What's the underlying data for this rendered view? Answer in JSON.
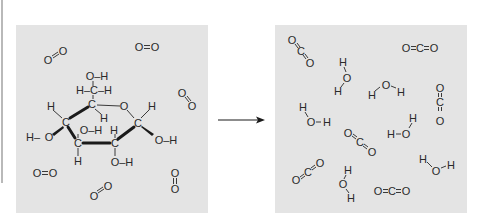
{
  "diagram": {
    "type": "chemical-reaction",
    "colors": {
      "panel_bg": "#e4e4e4",
      "ink": "#2a2a2a",
      "page_bg": "#ffffff",
      "edge_line": "#b9b9b9"
    },
    "reactants_panel": {
      "label": "reactants",
      "glucose": {
        "atoms": {
          "top_oh": "O–H",
          "ch2": "H–C–H",
          "c5": "C",
          "ring_o": "O",
          "c5_h": "H",
          "c4": "C",
          "c4_h": "H",
          "c4_o": "O",
          "c4_oh_h": "H–",
          "c3": "C",
          "c3_oh": "O–H",
          "c3_h": "H",
          "c2": "C",
          "c2_h": "H",
          "c2_oh": "O–H",
          "c1": "C",
          "c1_h": "H",
          "c1_oh": "O–H"
        }
      },
      "oxygen_molecules": [
        {
          "formula": "O=O",
          "orientation": "diagonal"
        },
        {
          "formula": "O=O",
          "orientation": "horizontal"
        },
        {
          "formula": "O=O",
          "orientation": "diagonal"
        },
        {
          "formula": "O=O",
          "orientation": "horizontal"
        },
        {
          "formula": "O=O",
          "orientation": "vertical"
        },
        {
          "formula": "O=O",
          "orientation": "diagonal"
        }
      ],
      "o2_count": 6
    },
    "arrow": {
      "direction": "right"
    },
    "products_panel": {
      "label": "products",
      "co2_molecules": [
        {
          "formula": "O=C=O",
          "orientation": "diagonal-down"
        },
        {
          "formula": "O=C=O",
          "orientation": "horizontal"
        },
        {
          "formula": "O=C=O",
          "orientation": "vertical"
        },
        {
          "formula": "O=C=O",
          "orientation": "diagonal-down"
        },
        {
          "formula": "O=C=O",
          "orientation": "diagonal-up"
        },
        {
          "formula": "O=C=O",
          "orientation": "horizontal"
        }
      ],
      "h2o_molecules": [
        {
          "formula": "H–O–H"
        },
        {
          "formula": "H–O–H"
        },
        {
          "formula": "H–O–H"
        },
        {
          "formula": "H–O–H"
        },
        {
          "formula": "H–O–H"
        },
        {
          "formula": "H–O–H"
        }
      ],
      "co2_count": 6,
      "h2o_count": 6
    },
    "glyphs": {
      "O": "O",
      "C": "C",
      "H": "H"
    }
  }
}
